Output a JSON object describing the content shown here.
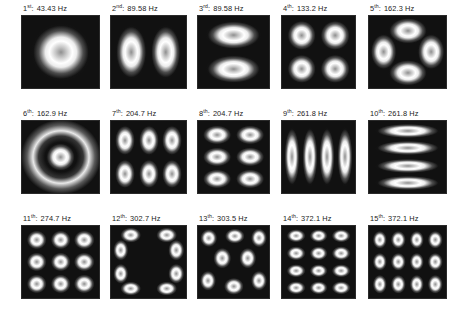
{
  "figure": {
    "kind": "mode-shape-grid",
    "background_color": "#ffffff",
    "panel_background_color": "#111111",
    "lobe_color": "#ffffff",
    "rows": 3,
    "columns": 5,
    "unit": "Hz"
  },
  "chart_data": {
    "type": "heatmap",
    "title": "",
    "xlabel": "",
    "ylabel": "",
    "layout": {
      "rows": 3,
      "cols": 5,
      "grid": false,
      "legend": "none"
    },
    "categories": [
      "1st",
      "2nd",
      "3rd",
      "4th",
      "5th",
      "6th",
      "7th",
      "8th",
      "9th",
      "10th",
      "11th",
      "12th",
      "13th",
      "14th",
      "15th"
    ],
    "values": [
      43.43,
      89.58,
      89.58,
      133.2,
      162.3,
      162.9,
      204.7,
      204.7,
      261.8,
      261.8,
      274.7,
      302.7,
      303.5,
      372.1,
      372.1
    ],
    "units": "Hz"
  },
  "modes": [
    {
      "index": "1",
      "ordinal_suffix": "st",
      "separator": ":",
      "frequency": "43.43 Hz",
      "label": "1st: 43.43 Hz",
      "pattern": "single-central-lobe",
      "lobes": [
        {
          "cx": 50,
          "cy": 50,
          "w": 78,
          "h": 80
        }
      ],
      "rings": []
    },
    {
      "index": "2",
      "ordinal_suffix": "nd",
      "separator": ":",
      "frequency": "89.58 Hz",
      "label": "2nd: 89.58 Hz",
      "pattern": "two-vertical-lobes",
      "lobes": [
        {
          "cx": 27,
          "cy": 50,
          "w": 42,
          "h": 76
        },
        {
          "cx": 73,
          "cy": 50,
          "w": 42,
          "h": 76
        }
      ],
      "rings": []
    },
    {
      "index": "3",
      "ordinal_suffix": "rd",
      "separator": ":",
      "frequency": "89.58 Hz",
      "label": "3rd: 89.58 Hz",
      "pattern": "two-horizontal-lobes",
      "lobes": [
        {
          "cx": 50,
          "cy": 27,
          "w": 80,
          "h": 40
        },
        {
          "cx": 50,
          "cy": 74,
          "w": 80,
          "h": 40
        }
      ],
      "rings": []
    },
    {
      "index": "4",
      "ordinal_suffix": "th",
      "separator": ":",
      "frequency": "133.2 Hz",
      "label": "4th: 133.2 Hz",
      "pattern": "two-by-two-grid",
      "lobes": [
        {
          "cx": 27,
          "cy": 27,
          "w": 42,
          "h": 42
        },
        {
          "cx": 73,
          "cy": 27,
          "w": 42,
          "h": 42
        },
        {
          "cx": 27,
          "cy": 73,
          "w": 42,
          "h": 42
        },
        {
          "cx": 73,
          "cy": 73,
          "w": 42,
          "h": 42
        }
      ],
      "rings": []
    },
    {
      "index": "5",
      "ordinal_suffix": "th",
      "separator": ":",
      "frequency": "162.3 Hz",
      "label": "5th: 162.3 Hz",
      "pattern": "four-lobe-diamond-x",
      "lobes": [
        {
          "cx": 50,
          "cy": 21,
          "w": 52,
          "h": 38
        },
        {
          "cx": 50,
          "cy": 79,
          "w": 52,
          "h": 38
        },
        {
          "cx": 19,
          "cy": 50,
          "w": 36,
          "h": 52
        },
        {
          "cx": 81,
          "cy": 50,
          "w": 36,
          "h": 52
        }
      ],
      "rings": []
    },
    {
      "index": "6",
      "ordinal_suffix": "th",
      "separator": ":",
      "frequency": "162.9 Hz",
      "label": "6th: 162.9 Hz",
      "pattern": "concentric-ring",
      "lobes": [
        {
          "cx": 50,
          "cy": 50,
          "w": 40,
          "h": 40
        }
      ],
      "rings": [
        {
          "cx": 50,
          "cy": 50,
          "w": 104,
          "h": 104
        }
      ]
    },
    {
      "index": "7",
      "ordinal_suffix": "th",
      "separator": ":",
      "frequency": "204.7 Hz",
      "label": "7th: 204.7 Hz",
      "pattern": "three-by-two-grid",
      "lobes": [
        {
          "cx": 19,
          "cy": 27,
          "w": 28,
          "h": 42
        },
        {
          "cx": 50,
          "cy": 27,
          "w": 28,
          "h": 42
        },
        {
          "cx": 81,
          "cy": 27,
          "w": 28,
          "h": 42
        },
        {
          "cx": 19,
          "cy": 73,
          "w": 28,
          "h": 42
        },
        {
          "cx": 50,
          "cy": 73,
          "w": 28,
          "h": 42
        },
        {
          "cx": 81,
          "cy": 73,
          "w": 28,
          "h": 42
        }
      ],
      "rings": []
    },
    {
      "index": "8",
      "ordinal_suffix": "th",
      "separator": ":",
      "frequency": "204.7 Hz",
      "label": "8th: 204.7 Hz",
      "pattern": "two-by-three-grid",
      "lobes": [
        {
          "cx": 27,
          "cy": 19,
          "w": 42,
          "h": 28
        },
        {
          "cx": 73,
          "cy": 19,
          "w": 42,
          "h": 28
        },
        {
          "cx": 27,
          "cy": 50,
          "w": 42,
          "h": 28
        },
        {
          "cx": 73,
          "cy": 50,
          "w": 42,
          "h": 28
        },
        {
          "cx": 27,
          "cy": 81,
          "w": 42,
          "h": 28
        },
        {
          "cx": 73,
          "cy": 81,
          "w": 42,
          "h": 28
        }
      ],
      "rings": []
    },
    {
      "index": "9",
      "ordinal_suffix": "th",
      "separator": ":",
      "frequency": "261.8 Hz",
      "label": "9th: 261.8 Hz",
      "pattern": "four-vertical-stripes",
      "lobes": [
        {
          "cx": 14,
          "cy": 50,
          "w": 22,
          "h": 84
        },
        {
          "cx": 38,
          "cy": 50,
          "w": 22,
          "h": 84
        },
        {
          "cx": 62,
          "cy": 50,
          "w": 22,
          "h": 84
        },
        {
          "cx": 86,
          "cy": 50,
          "w": 22,
          "h": 84
        }
      ],
      "rings": []
    },
    {
      "index": "10",
      "ordinal_suffix": "th",
      "separator": ":",
      "frequency": "261.8 Hz",
      "label": "10th: 261.8 Hz",
      "pattern": "four-horizontal-stripes",
      "lobes": [
        {
          "cx": 50,
          "cy": 14,
          "w": 86,
          "h": 21
        },
        {
          "cx": 50,
          "cy": 38,
          "w": 86,
          "h": 21
        },
        {
          "cx": 50,
          "cy": 62,
          "w": 86,
          "h": 21
        },
        {
          "cx": 50,
          "cy": 86,
          "w": 86,
          "h": 21
        }
      ],
      "rings": []
    },
    {
      "index": "11",
      "ordinal_suffix": "th",
      "separator": ":",
      "frequency": "274.7 Hz",
      "label": "11th: 274.7 Hz",
      "pattern": "three-by-three-grid",
      "lobes": [
        {
          "cx": 19,
          "cy": 19,
          "w": 28,
          "h": 28
        },
        {
          "cx": 50,
          "cy": 19,
          "w": 28,
          "h": 28
        },
        {
          "cx": 81,
          "cy": 19,
          "w": 28,
          "h": 28
        },
        {
          "cx": 19,
          "cy": 50,
          "w": 28,
          "h": 28
        },
        {
          "cx": 50,
          "cy": 50,
          "w": 28,
          "h": 28
        },
        {
          "cx": 81,
          "cy": 50,
          "w": 28,
          "h": 28
        },
        {
          "cx": 19,
          "cy": 81,
          "w": 28,
          "h": 28
        },
        {
          "cx": 50,
          "cy": 81,
          "w": 28,
          "h": 28
        },
        {
          "cx": 81,
          "cy": 81,
          "w": 28,
          "h": 28
        }
      ],
      "rings": []
    },
    {
      "index": "12",
      "ordinal_suffix": "th",
      "separator": ":",
      "frequency": "302.7 Hz",
      "label": "12th: 302.7 Hz",
      "pattern": "eight-lobe-radial",
      "lobes": [
        {
          "cx": 26,
          "cy": 13,
          "w": 30,
          "h": 22
        },
        {
          "cx": 74,
          "cy": 13,
          "w": 30,
          "h": 22
        },
        {
          "cx": 13,
          "cy": 34,
          "w": 22,
          "h": 30
        },
        {
          "cx": 87,
          "cy": 34,
          "w": 22,
          "h": 30
        },
        {
          "cx": 13,
          "cy": 66,
          "w": 22,
          "h": 30
        },
        {
          "cx": 87,
          "cy": 66,
          "w": 22,
          "h": 30
        },
        {
          "cx": 26,
          "cy": 87,
          "w": 30,
          "h": 22
        },
        {
          "cx": 74,
          "cy": 87,
          "w": 30,
          "h": 22
        }
      ],
      "rings": []
    },
    {
      "index": "13",
      "ordinal_suffix": "th",
      "separator": ":",
      "frequency": "303.5 Hz",
      "label": "13th: 303.5 Hz",
      "pattern": "eight-lobe-radial-rotated",
      "lobes": [
        {
          "cx": 15,
          "cy": 17,
          "w": 26,
          "h": 26
        },
        {
          "cx": 52,
          "cy": 14,
          "w": 30,
          "h": 22
        },
        {
          "cx": 86,
          "cy": 17,
          "w": 24,
          "h": 28
        },
        {
          "cx": 34,
          "cy": 45,
          "w": 26,
          "h": 30
        },
        {
          "cx": 70,
          "cy": 45,
          "w": 26,
          "h": 30
        },
        {
          "cx": 14,
          "cy": 76,
          "w": 24,
          "h": 30
        },
        {
          "cx": 50,
          "cy": 84,
          "w": 30,
          "h": 24
        },
        {
          "cx": 86,
          "cy": 76,
          "w": 24,
          "h": 30
        }
      ],
      "rings": []
    },
    {
      "index": "14",
      "ordinal_suffix": "th",
      "separator": ":",
      "frequency": "372.1 Hz",
      "label": "14th: 372.1 Hz",
      "pattern": "three-by-four-grid",
      "lobes": [
        {
          "cx": 19,
          "cy": 14,
          "w": 27,
          "h": 20
        },
        {
          "cx": 50,
          "cy": 14,
          "w": 27,
          "h": 20
        },
        {
          "cx": 81,
          "cy": 14,
          "w": 27,
          "h": 20
        },
        {
          "cx": 19,
          "cy": 38,
          "w": 27,
          "h": 20
        },
        {
          "cx": 50,
          "cy": 38,
          "w": 27,
          "h": 20
        },
        {
          "cx": 81,
          "cy": 38,
          "w": 27,
          "h": 20
        },
        {
          "cx": 19,
          "cy": 62,
          "w": 27,
          "h": 20
        },
        {
          "cx": 50,
          "cy": 62,
          "w": 27,
          "h": 20
        },
        {
          "cx": 81,
          "cy": 62,
          "w": 27,
          "h": 20
        },
        {
          "cx": 19,
          "cy": 86,
          "w": 27,
          "h": 20
        },
        {
          "cx": 50,
          "cy": 86,
          "w": 27,
          "h": 20
        },
        {
          "cx": 81,
          "cy": 86,
          "w": 27,
          "h": 20
        }
      ],
      "rings": []
    },
    {
      "index": "15",
      "ordinal_suffix": "th",
      "separator": ":",
      "frequency": "372.1 Hz",
      "label": "15th: 372.1 Hz",
      "pattern": "four-by-three-grid",
      "lobes": [
        {
          "cx": 14,
          "cy": 19,
          "w": 20,
          "h": 27
        },
        {
          "cx": 38,
          "cy": 19,
          "w": 20,
          "h": 27
        },
        {
          "cx": 62,
          "cy": 19,
          "w": 20,
          "h": 27
        },
        {
          "cx": 86,
          "cy": 19,
          "w": 20,
          "h": 27
        },
        {
          "cx": 14,
          "cy": 50,
          "w": 20,
          "h": 27
        },
        {
          "cx": 38,
          "cy": 50,
          "w": 20,
          "h": 27
        },
        {
          "cx": 62,
          "cy": 50,
          "w": 20,
          "h": 27
        },
        {
          "cx": 86,
          "cy": 50,
          "w": 20,
          "h": 27
        },
        {
          "cx": 14,
          "cy": 81,
          "w": 20,
          "h": 27
        },
        {
          "cx": 38,
          "cy": 81,
          "w": 20,
          "h": 27
        },
        {
          "cx": 62,
          "cy": 81,
          "w": 20,
          "h": 27
        },
        {
          "cx": 86,
          "cy": 81,
          "w": 20,
          "h": 27
        }
      ],
      "rings": []
    }
  ]
}
